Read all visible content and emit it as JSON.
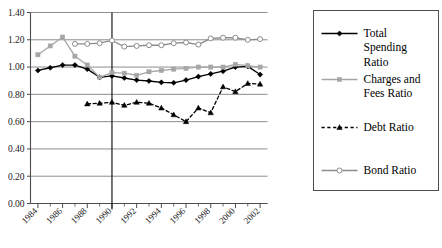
{
  "chart_data": {
    "type": "line",
    "title": "",
    "subtitle": "",
    "xlabel": "",
    "ylabel": "",
    "ylim": [
      0.0,
      1.4
    ],
    "ytick_labels": [
      "0.00",
      "0.20",
      "0.40",
      "0.60",
      "0.80",
      "1.00",
      "1.20",
      "1.40"
    ],
    "ytick_values": [
      0.0,
      0.2,
      0.4,
      0.6,
      0.8,
      1.0,
      1.2,
      1.4
    ],
    "grid": true,
    "grid_axis": "y",
    "legend_position": "right",
    "x": [
      1984,
      1985,
      1986,
      1987,
      1988,
      1989,
      1990,
      1991,
      1992,
      1993,
      1994,
      1995,
      1996,
      1997,
      1998,
      1999,
      2000,
      2001,
      2002
    ],
    "xtick_labels": [
      "1984",
      "1986",
      "1988",
      "1990",
      "1992",
      "1994",
      "1996",
      "1998",
      "2000",
      "2002"
    ],
    "xtick_values": [
      1984,
      1986,
      1988,
      1990,
      1992,
      1994,
      1996,
      1998,
      2000,
      2002
    ],
    "xlim": [
      1983.4,
      2002.6
    ],
    "annotations": [
      {
        "name": "vertical-reference-line",
        "x": 1990,
        "label": ""
      }
    ],
    "series": [
      {
        "name": "Total Spending Ratio",
        "color": "#000000",
        "marker": "diamond",
        "line_style": "solid",
        "x": [
          1984,
          1985,
          1986,
          1987,
          1988,
          1989,
          1990,
          1991,
          1992,
          1993,
          1994,
          1995,
          1996,
          1997,
          1998,
          1999,
          2000,
          2001,
          2002
        ],
        "values": [
          0.975,
          0.995,
          1.015,
          1.015,
          0.985,
          0.925,
          0.935,
          0.92,
          0.905,
          0.898,
          0.888,
          0.885,
          0.905,
          0.93,
          0.95,
          0.97,
          1.0,
          1.005,
          0.945
        ]
      },
      {
        "name": "Charges and Fees Ratio",
        "color": "#a6a6a6",
        "marker": "square",
        "line_style": "solid",
        "x": [
          1984,
          1985,
          1986,
          1987,
          1988,
          1989,
          1990,
          1991,
          1992,
          1993,
          1994,
          1995,
          1996,
          1997,
          1998,
          1999,
          2000,
          2001,
          2002
        ],
        "values": [
          1.09,
          1.155,
          1.22,
          1.08,
          1.015,
          0.925,
          0.96,
          0.955,
          0.94,
          0.965,
          0.975,
          0.985,
          0.99,
          1.0,
          1.0,
          1.0,
          1.02,
          1.01,
          1.0
        ]
      },
      {
        "name": "Debt Ratio",
        "color": "#000000",
        "marker": "triangle",
        "line_style": "dashed",
        "x": [
          1988,
          1989,
          1990,
          1991,
          1992,
          1993,
          1994,
          1995,
          1996,
          1997,
          1998,
          1999,
          2000,
          2001,
          2002
        ],
        "values": [
          0.73,
          0.735,
          0.742,
          0.72,
          0.742,
          0.735,
          0.7,
          0.65,
          0.6,
          0.7,
          0.665,
          0.855,
          0.82,
          0.88,
          0.875
        ]
      },
      {
        "name": "Bond Ratio",
        "color": "#8c8c8c",
        "marker": "circle-open",
        "line_style": "solid",
        "x": [
          1987,
          1988,
          1989,
          1990,
          1991,
          1992,
          1993,
          1994,
          1995,
          1996,
          1997,
          1998,
          1999,
          2000,
          2001,
          2002
        ],
        "values": [
          1.17,
          1.17,
          1.175,
          1.195,
          1.15,
          1.155,
          1.16,
          1.16,
          1.175,
          1.18,
          1.165,
          1.21,
          1.215,
          1.215,
          1.2,
          1.205
        ]
      }
    ]
  },
  "legend": {
    "items": [
      {
        "label": "Total Spending Ratio",
        "marker": "diamond",
        "line_style": "solid",
        "color": "#000000"
      },
      {
        "label": "Charges and Fees Ratio",
        "marker": "square",
        "line_style": "solid",
        "color": "#a6a6a6"
      },
      {
        "label": "Debt Ratio",
        "marker": "triangle",
        "line_style": "dashed",
        "color": "#000000"
      },
      {
        "label": "Bond Ratio",
        "marker": "circle-open",
        "line_style": "solid",
        "color": "#8c8c8c"
      }
    ]
  }
}
